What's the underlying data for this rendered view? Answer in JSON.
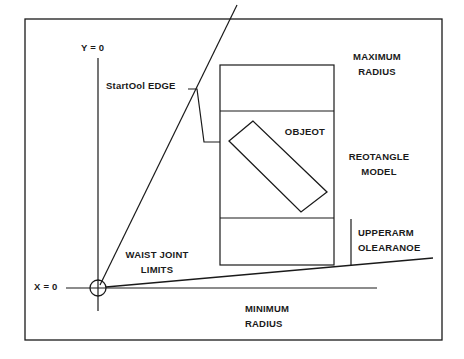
{
  "diagram": {
    "type": "robot-workspace-schematic",
    "labels": {
      "y_axis": "Y = 0",
      "x_axis": "X = 0",
      "startool_edge": "StartOol EDGE",
      "maximum_radius_1": "MAXIMUM",
      "maximum_radius_2": "RADIUS",
      "object": "OBJEOT",
      "rectangle_model_1": "REOTANGLE",
      "rectangle_model_2": "MODEL",
      "upperarm_clearance_1": "UPPERARM",
      "upperarm_clearance_2": "OLEARANOE",
      "waist_joint_limits_1": "WAIST JOINT",
      "waist_joint_limits_2": "LIMITS",
      "minimum_radius_1": "MINIMUM",
      "minimum_radius_2": "RADIUS"
    },
    "colors": {
      "background": "#ffffff",
      "stroke": "#1a1a1a"
    }
  }
}
